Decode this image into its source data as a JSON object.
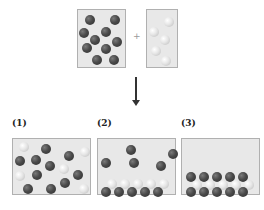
{
  "reactants": {
    "plus_sign": "+",
    "box_a": {
      "type": "dark",
      "count": 10,
      "spheres": [
        [
          90,
          20
        ],
        [
          115,
          20
        ],
        [
          84,
          33
        ],
        [
          106,
          32
        ],
        [
          95,
          40
        ],
        [
          117,
          42
        ],
        [
          87,
          48
        ],
        [
          106,
          49
        ],
        [
          97,
          60
        ],
        [
          114,
          60
        ]
      ]
    },
    "box_b": {
      "type": "light",
      "count": 5,
      "spheres": [
        [
          169,
          22
        ],
        [
          154,
          32
        ],
        [
          165,
          40
        ],
        [
          156,
          51
        ],
        [
          166,
          61
        ]
      ]
    }
  },
  "arrow": {
    "direction": "down"
  },
  "options": [
    {
      "label": "(1)",
      "spheres": [
        {
          "t": "light",
          "x": 23,
          "y": 46
        },
        {
          "t": "dark",
          "x": 45,
          "y": 48
        },
        {
          "t": "dark",
          "x": 68,
          "y": 55
        },
        {
          "t": "light",
          "x": 84,
          "y": 51
        },
        {
          "t": "dark",
          "x": 19,
          "y": 60
        },
        {
          "t": "dark",
          "x": 35,
          "y": 59
        },
        {
          "t": "dark",
          "x": 49,
          "y": 65
        },
        {
          "t": "light",
          "x": 63,
          "y": 68
        },
        {
          "t": "light",
          "x": 19,
          "y": 75
        },
        {
          "t": "dark",
          "x": 36,
          "y": 74
        },
        {
          "t": "dark",
          "x": 77,
          "y": 74
        },
        {
          "t": "dark",
          "x": 27,
          "y": 88
        },
        {
          "t": "dark",
          "x": 50,
          "y": 88
        },
        {
          "t": "dark",
          "x": 64,
          "y": 82
        },
        {
          "t": "light",
          "x": 83,
          "y": 88
        }
      ]
    },
    {
      "label": "(2)",
      "spheres": [
        {
          "t": "dark",
          "x": 33,
          "y": 11
        },
        {
          "t": "dark",
          "x": 75,
          "y": 15
        },
        {
          "t": "dark",
          "x": 8,
          "y": 24
        },
        {
          "t": "dark",
          "x": 36,
          "y": 24
        },
        {
          "t": "dark",
          "x": 63,
          "y": 27
        },
        {
          "t": "light",
          "x": 14,
          "y": 45
        },
        {
          "t": "light",
          "x": 27,
          "y": 45
        },
        {
          "t": "light",
          "x": 40,
          "y": 45
        },
        {
          "t": "light",
          "x": 53,
          "y": 45
        },
        {
          "t": "light",
          "x": 66,
          "y": 45
        },
        {
          "t": "dark",
          "x": 8,
          "y": 53
        },
        {
          "t": "dark",
          "x": 21,
          "y": 53
        },
        {
          "t": "dark",
          "x": 34,
          "y": 53
        },
        {
          "t": "dark",
          "x": 47,
          "y": 53
        },
        {
          "t": "dark",
          "x": 60,
          "y": 53
        }
      ]
    },
    {
      "label": "(3)",
      "spheres": [
        {
          "t": "dark",
          "x": 9,
          "y": 38
        },
        {
          "t": "dark",
          "x": 22,
          "y": 38
        },
        {
          "t": "dark",
          "x": 35,
          "y": 38
        },
        {
          "t": "dark",
          "x": 48,
          "y": 38
        },
        {
          "t": "dark",
          "x": 61,
          "y": 38
        },
        {
          "t": "light",
          "x": 15,
          "y": 46
        },
        {
          "t": "light",
          "x": 28,
          "y": 46
        },
        {
          "t": "light",
          "x": 41,
          "y": 46
        },
        {
          "t": "light",
          "x": 54,
          "y": 46
        },
        {
          "t": "light",
          "x": 67,
          "y": 46
        },
        {
          "t": "dark",
          "x": 9,
          "y": 53
        },
        {
          "t": "dark",
          "x": 22,
          "y": 53
        },
        {
          "t": "dark",
          "x": 35,
          "y": 53
        },
        {
          "t": "dark",
          "x": 48,
          "y": 53
        },
        {
          "t": "dark",
          "x": 61,
          "y": 53
        }
      ]
    }
  ],
  "colors": {
    "box_bg": "#e8e8e8",
    "box_border": "#b0b0b0",
    "dark_sphere": "#3f3f3f",
    "light_sphere": "#e6e6e6",
    "arrow": "#333333"
  }
}
